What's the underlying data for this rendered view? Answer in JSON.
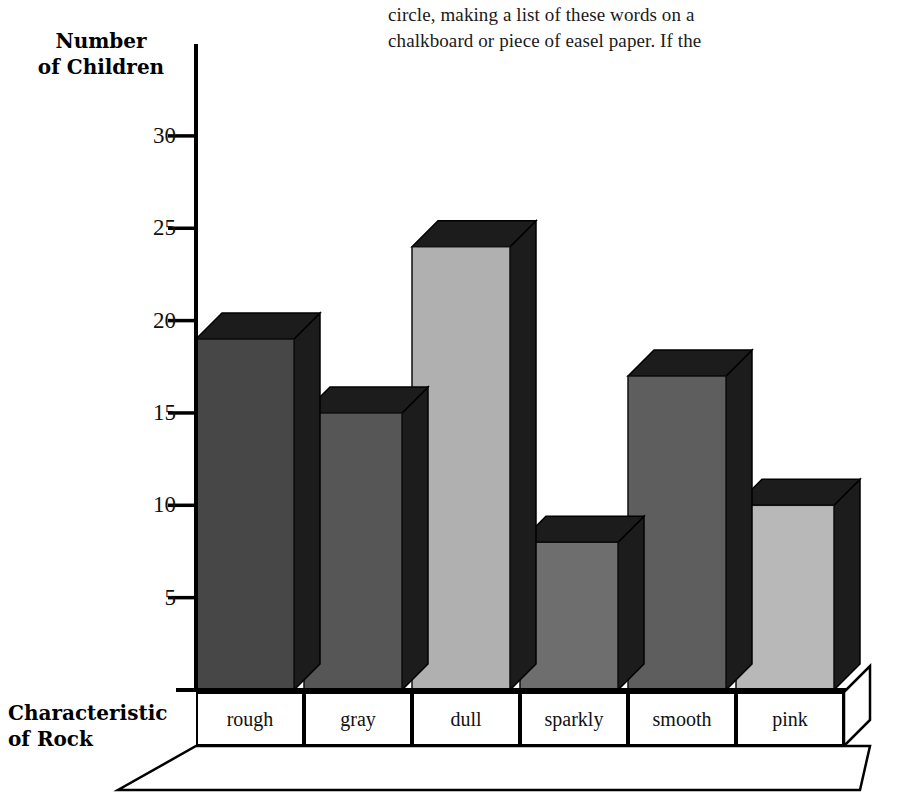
{
  "body_text": {
    "line1": "circle, making a list of these words on a",
    "line2": "chalkboard or piece of easel paper. If the"
  },
  "axis_titles": {
    "y_line1": "Number",
    "y_line2": "of Children",
    "x_line1": "Characteristic",
    "x_line2": "of Rock"
  },
  "chart_data": {
    "type": "bar",
    "title": "",
    "xlabel": "Characteristic of Rock",
    "ylabel": "Number of Children",
    "categories": [
      "rough",
      "gray",
      "dull",
      "sparkly",
      "smooth",
      "pink"
    ],
    "values": [
      19,
      15,
      24,
      8,
      17,
      10
    ],
    "ylim": [
      0,
      32
    ],
    "yticks": [
      5,
      10,
      15,
      20,
      25,
      30
    ],
    "ytick_labels": [
      "5",
      "10",
      "15",
      "20",
      "25",
      "30"
    ],
    "grid": false,
    "legend": null,
    "style": "3d-perspective-bars",
    "bar_colors": [
      "#474747",
      "#565656",
      "#b0b0b0",
      "#6e6e6e",
      "#5e5e5e",
      "#b8b8b8"
    ],
    "bar_side_color": "#1c1c1c",
    "axis_color": "#000000"
  }
}
